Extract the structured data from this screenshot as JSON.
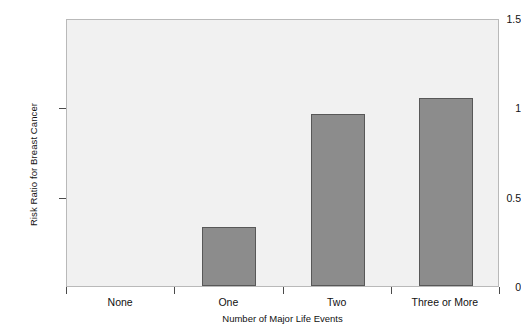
{
  "chart_data": {
    "type": "bar",
    "title": "",
    "xlabel": "Number of Major Life Events",
    "ylabel": "Risk Ratio for Breast Cancer",
    "categories": [
      "None",
      "One",
      "Two",
      "Three or More"
    ],
    "values": [
      0,
      0.33,
      0.96,
      1.05
    ],
    "ylim": [
      0,
      1.5
    ],
    "yticks": [
      0,
      0.5,
      1,
      1.5
    ],
    "ytick_labels": [
      "0",
      "0.5",
      "1",
      "1.5"
    ],
    "grid": false,
    "legend": null,
    "colors": {
      "bar_fill": "#8c8c8c",
      "bar_edge": "#585858",
      "plot_background": "#f1f1f1",
      "frame": "#b9b9b9",
      "text": "#111111",
      "page_background": "#ffffff"
    }
  }
}
